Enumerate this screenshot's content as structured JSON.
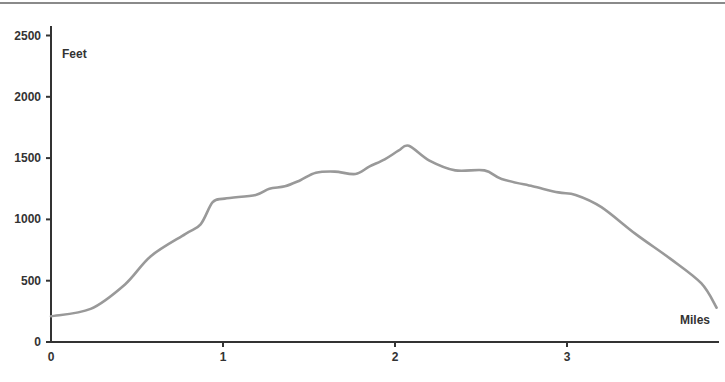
{
  "chart_data": {
    "type": "line",
    "title": "",
    "xlabel": "Miles",
    "ylabel": "Feet",
    "xlim": [
      0,
      3.9
    ],
    "ylim": [
      0,
      2500
    ],
    "grid": false,
    "legend": null,
    "x_ticks": [
      0,
      1,
      2,
      3
    ],
    "y_ticks": [
      0,
      500,
      1000,
      1500,
      2000,
      2500
    ],
    "series": [
      {
        "name": "Elevation",
        "color": "#999999",
        "x": [
          0,
          0.23,
          0.43,
          0.58,
          0.78,
          0.87,
          0.94,
          1.01,
          1.19,
          1.27,
          1.36,
          1.45,
          1.54,
          1.65,
          1.77,
          1.85,
          1.94,
          2.02,
          2.08,
          2.2,
          2.35,
          2.52,
          2.62,
          2.8,
          2.95,
          3.05,
          3.2,
          3.4,
          3.6,
          3.78,
          3.87
        ],
        "y": [
          210,
          270,
          470,
          700,
          880,
          960,
          1140,
          1170,
          1200,
          1250,
          1270,
          1320,
          1380,
          1390,
          1370,
          1430,
          1490,
          1560,
          1600,
          1480,
          1400,
          1400,
          1330,
          1270,
          1220,
          1200,
          1100,
          880,
          680,
          480,
          280
        ]
      }
    ]
  },
  "axes": {
    "x_label": "Miles",
    "y_label": "Feet",
    "x_tick_labels": [
      "0",
      "1",
      "2",
      "3"
    ],
    "y_tick_labels": [
      "0",
      "500",
      "1000",
      "1500",
      "2000",
      "2500"
    ]
  }
}
